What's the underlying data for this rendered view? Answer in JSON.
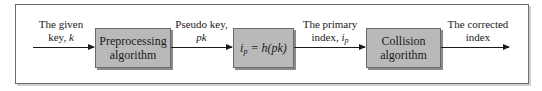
{
  "diagram": {
    "type": "flowchart",
    "direction": "left-to-right",
    "inputs": {
      "given_key": {
        "line1": "The given",
        "line2_prefix": "key, ",
        "line2_var": "k"
      },
      "pseudo_key": {
        "line1": "Pseudo key,",
        "line2_var": "pk"
      },
      "primary_index": {
        "line1": "The primary",
        "line2_prefix": "index, ",
        "line2_var": "i",
        "line2_sub": "p"
      },
      "corrected_index": {
        "line1": "The corrected",
        "line2": "index"
      }
    },
    "boxes": [
      {
        "id": "preprocessing",
        "line1": "Preprocessing",
        "line2": "algorithm"
      },
      {
        "id": "hash",
        "var": "i",
        "sub": "p",
        "rest": " = h(pk)"
      },
      {
        "id": "collision",
        "line1": "Collision",
        "line2": "algorithm"
      }
    ],
    "edges": [
      {
        "from": "input",
        "to": "preprocessing",
        "label": "The given key, k"
      },
      {
        "from": "preprocessing",
        "to": "hash",
        "label": "Pseudo key, pk"
      },
      {
        "from": "hash",
        "to": "collision",
        "label": "The primary index, i_p"
      },
      {
        "from": "collision",
        "to": "output",
        "label": "The corrected index"
      }
    ],
    "colors": {
      "box_fill": "#b9b9b9",
      "box_border": "#6a6a6a",
      "frame_border": "#6d6d6d",
      "arrow": "#1a1a1a",
      "text": "#1a1a1a"
    }
  }
}
